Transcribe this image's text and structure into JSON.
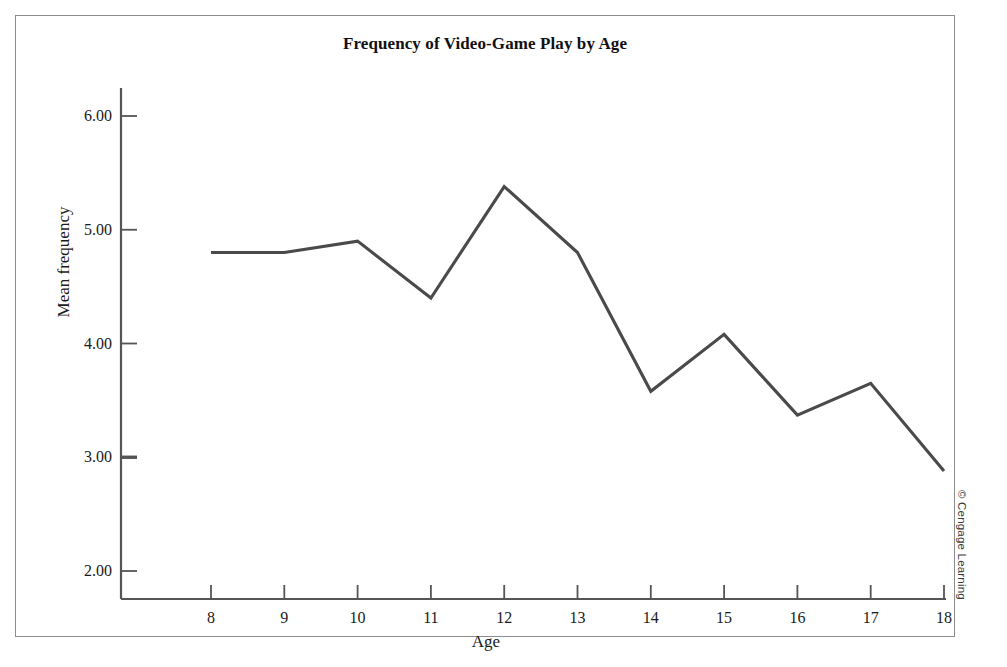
{
  "figure": {
    "title": "Frequency of Video-Game Play by Age",
    "credit": "© Cengage Learning"
  },
  "chart_data": {
    "type": "line",
    "title": "Frequency of Video-Game Play by Age",
    "xlabel": "Age",
    "ylabel": "Mean frequency",
    "x": [
      8,
      9,
      10,
      11,
      12,
      13,
      14,
      15,
      16,
      17,
      18
    ],
    "categories": [
      "8",
      "9",
      "10",
      "11",
      "12",
      "13",
      "14",
      "15",
      "16",
      "17",
      "18"
    ],
    "values": [
      4.8,
      4.8,
      4.9,
      4.4,
      5.38,
      4.8,
      3.58,
      4.08,
      3.37,
      3.65,
      2.88
    ],
    "series": [
      {
        "name": "Mean frequency",
        "values": [
          4.8,
          4.8,
          4.9,
          4.4,
          5.38,
          4.8,
          3.58,
          4.08,
          3.37,
          3.65,
          2.88
        ],
        "color": "#4a4a4a"
      }
    ],
    "xlim": [
      7.5,
      18.5
    ],
    "ylim": [
      1.7,
      6.3
    ],
    "ytick_labels": [
      "2.00",
      "3.00",
      "4.00",
      "5.00",
      "6.00"
    ],
    "ytick_values": [
      2,
      3,
      4,
      5,
      6
    ],
    "xtick_labels": [
      "8",
      "9",
      "10",
      "11",
      "12",
      "13",
      "14",
      "15",
      "16",
      "17",
      "18"
    ],
    "grid": false,
    "legend": false,
    "marker": "none",
    "line_color": "#4a4a4a",
    "axis_color": "#555555"
  }
}
